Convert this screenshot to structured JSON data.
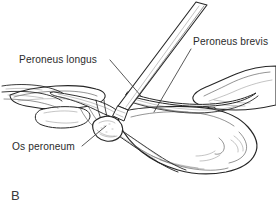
{
  "figure": {
    "panel_letter": "B",
    "type": "anatomical line illustration",
    "background_color": "#ffffff",
    "ink_color": "#262626",
    "text_color": "#2b2b2b"
  },
  "labels": {
    "peroneus_longus": "Peroneus longus",
    "peroneus_brevis": "Peroneus brevis",
    "os_peroneum": "Os peroneum"
  },
  "label_positions": {
    "peroneus_longus": {
      "x": 19,
      "y": 63
    },
    "peroneus_brevis": {
      "x": 193,
      "y": 45
    },
    "os_peroneum": {
      "x": 12,
      "y": 150
    }
  },
  "leaders": [
    {
      "name": "peroneus-longus-leader",
      "x1": 110,
      "y1": 60,
      "x2": 141,
      "y2": 96
    },
    {
      "name": "peroneus-brevis-leader",
      "x1": 191,
      "y1": 49,
      "x2": 154,
      "y2": 112
    },
    {
      "name": "os-peroneum-leader",
      "x1": 82,
      "y1": 146,
      "x2": 106,
      "y2": 126
    }
  ],
  "structures": [
    {
      "name": "peroneus-longus-tendon",
      "description": "tendon coursing from proximal left across to the os peroneum"
    },
    {
      "name": "peroneus-brevis-tendon",
      "description": "tendon coursing to the right over the calcaneus"
    },
    {
      "name": "os-peroneum-sesamoid",
      "description": "rounded sesamoid nodule within the peroneus longus tendon"
    },
    {
      "name": "calcaneus-bone",
      "description": "large bone body occupying the lower right of the field"
    },
    {
      "name": "cuboid-bone",
      "description": "bone at left of the field"
    },
    {
      "name": "fibula-malleolus",
      "description": "bone structure upper right"
    },
    {
      "name": "surgical-elevator-instrument",
      "description": "straight metal instrument entering from upper right, tip beneath tendon"
    }
  ]
}
